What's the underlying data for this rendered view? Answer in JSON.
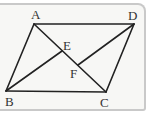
{
  "diagram": {
    "type": "parallelogram with diagonals",
    "points": {
      "A": {
        "label": "A",
        "x": 34,
        "y": 24
      },
      "D": {
        "label": "D",
        "x": 134,
        "y": 24
      },
      "B": {
        "label": "B",
        "x": 6,
        "y": 91
      },
      "C": {
        "label": "C",
        "x": 106,
        "y": 92
      },
      "E": {
        "label": "E",
        "x": 62,
        "y": 51
      },
      "F": {
        "label": "F",
        "x": 78,
        "y": 65
      }
    },
    "segments": [
      "AD",
      "BC",
      "AB",
      "DC",
      "AC",
      "BE",
      "DF"
    ],
    "line_color": "#222222",
    "background_color": "#f7f7f5",
    "frame_color": "#c9c9c9"
  }
}
